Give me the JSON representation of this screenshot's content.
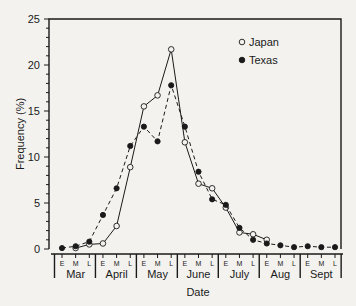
{
  "chart_data": {
    "type": "line",
    "title": "",
    "xlabel": "Date",
    "ylabel": "Frequency (%)",
    "ylim": [
      0,
      25
    ],
    "yticks": [
      0,
      5,
      10,
      15,
      20,
      25
    ],
    "months": [
      "Mar",
      "April",
      "May",
      "June",
      "July",
      "Aug",
      "Sept"
    ],
    "subperiods": [
      "E",
      "M",
      "L"
    ],
    "categories": [
      "Mar E",
      "Mar M",
      "Mar L",
      "Apr E",
      "Apr M",
      "Apr L",
      "May E",
      "May M",
      "May L",
      "Jun E",
      "Jun M",
      "Jun L",
      "Jul E",
      "Jul M",
      "Jul L",
      "Aug E",
      "Aug M",
      "Aug L",
      "Sep E",
      "Sep M",
      "Sep L"
    ],
    "legend_position": "upper right",
    "grid": false,
    "series": [
      {
        "name": "Japan",
        "marker": "open-circle",
        "line": "solid",
        "values": [
          null,
          0.1,
          0.5,
          0.6,
          2.5,
          8.9,
          15.5,
          16.7,
          21.7,
          11.6,
          7.1,
          6.6,
          4.5,
          1.8,
          1.6,
          1.0,
          null,
          null,
          null,
          null,
          null
        ]
      },
      {
        "name": "Texas",
        "marker": "filled-circle",
        "line": "dashed",
        "values": [
          0.1,
          0.3,
          0.8,
          3.7,
          6.6,
          11.2,
          13.3,
          11.7,
          17.8,
          13.3,
          8.4,
          5.4,
          4.8,
          2.3,
          1.0,
          0.6,
          0.4,
          0.2,
          0.3,
          0.2,
          0.2
        ]
      }
    ]
  }
}
